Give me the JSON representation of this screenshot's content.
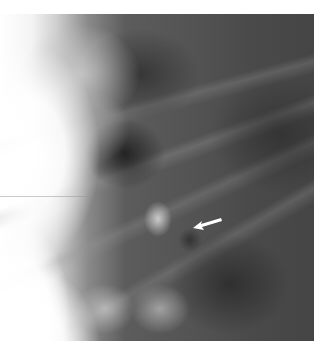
{
  "image": {
    "type": "radiograph",
    "description": "Chest X-ray crop showing ribs and lung field with a white arrow pointing to a dark nodular region",
    "annotation": {
      "icon": "arrow-icon",
      "direction": "left-down",
      "color": "#ffffff"
    }
  }
}
